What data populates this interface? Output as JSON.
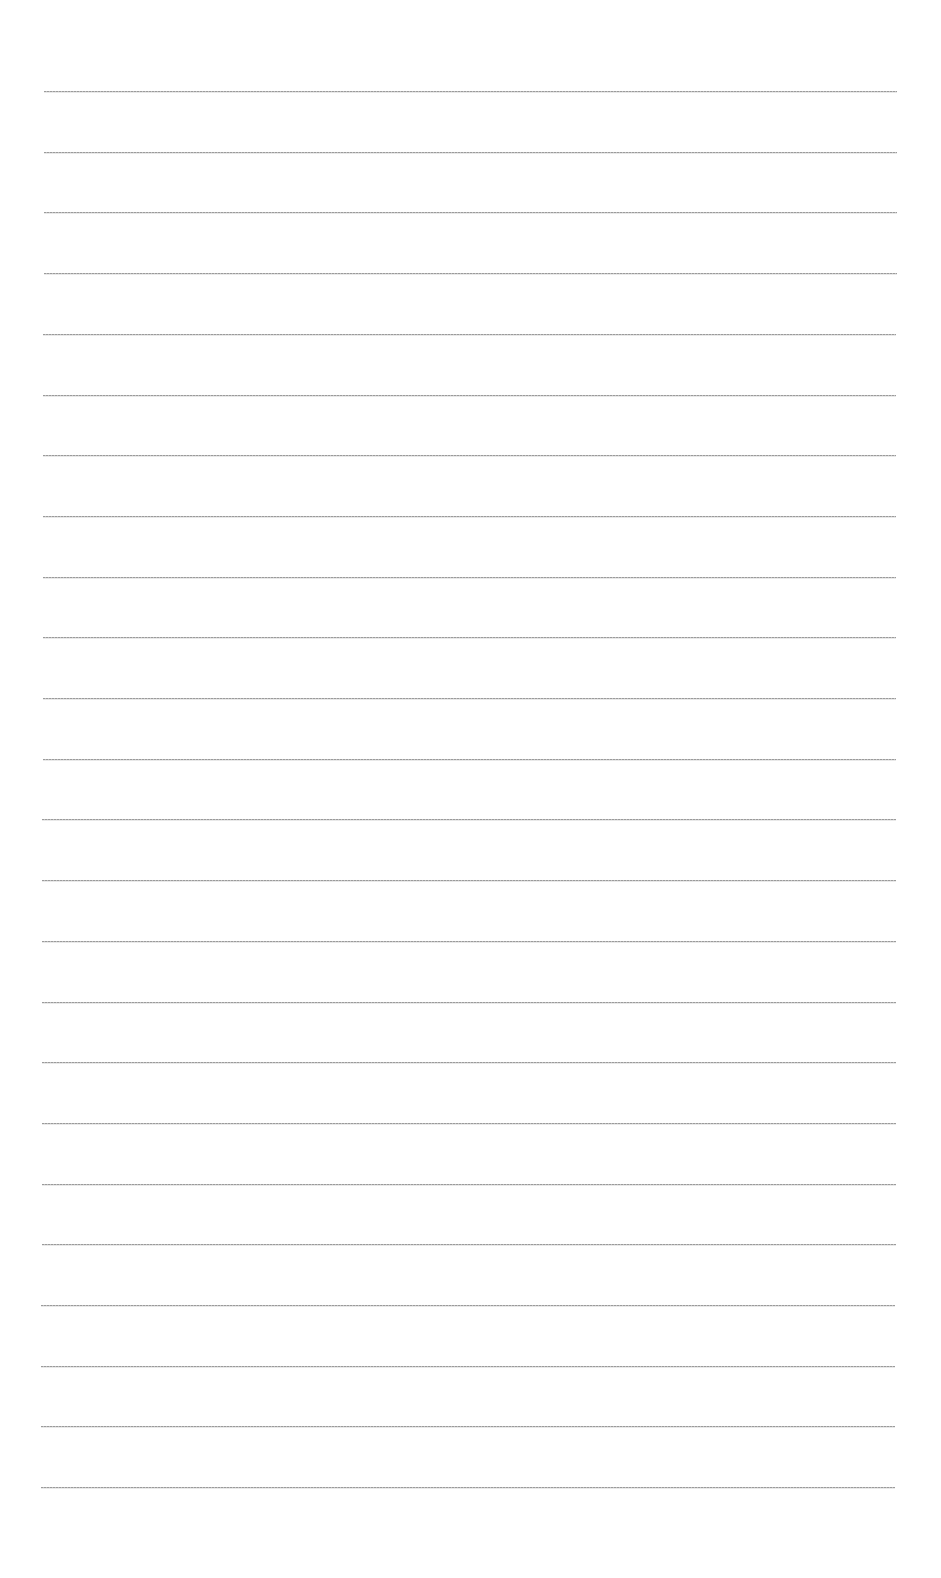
{
  "document": {
    "type": "blank-ruled-paper",
    "background_color": "#ffffff",
    "line_color": "#8a8a8a",
    "line_count": 24,
    "first_line_y": 91,
    "line_spacing": 60.7,
    "line_left_top": 44,
    "line_right_top": 897,
    "line_left_bottom": 41,
    "line_right_bottom": 895,
    "text_content": ""
  }
}
